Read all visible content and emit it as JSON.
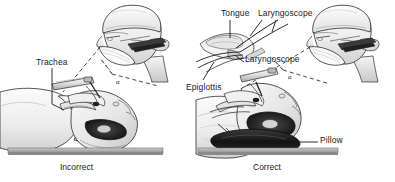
{
  "figure": {
    "width": 395,
    "height": 182,
    "background_color": "#ffffff"
  },
  "panels": [
    {
      "id": "incorrect",
      "caption": "Incorrect",
      "description": "Supine patient with head flat on the table, no pillow; laryngoscope inserted, line of sight misaligned",
      "angle_label": "α",
      "labels": [
        {
          "name": "trachea",
          "text": "Trachea"
        }
      ]
    },
    {
      "id": "correct",
      "caption": "Correct",
      "description": "Supine patient with head elevated on a pillow in sniffing position; laryngoscope inserted, line of sight aligned",
      "angle_label": "α",
      "labels": [
        {
          "name": "tongue",
          "text": "Tongue"
        },
        {
          "name": "laryngoscope-upper",
          "text": "Laryngoscope"
        },
        {
          "name": "laryngoscope-lower",
          "text": "Laryngoscope"
        },
        {
          "name": "epiglottis",
          "text": "Epiglottis"
        },
        {
          "name": "pillow",
          "text": "Pillow"
        }
      ]
    }
  ],
  "labels": {
    "trachea": "Trachea",
    "tongue": "Tongue",
    "laryngoscope_upper": "Laryngoscope",
    "laryngoscope_lower": "Laryngoscope",
    "epiglottis": "Epiglottis",
    "pillow": "Pillow",
    "angle_alpha": "α"
  },
  "captions": {
    "incorrect": "Incorrect",
    "correct": "Correct"
  },
  "colors": {
    "line": "#1a1a1a",
    "label_text": "#1a1a1a",
    "skin_light": "#f2f2f2",
    "skin_shade": "#d9d9d9",
    "skin_shadow": "#bdbdbd",
    "table_top": "#b5b5b5",
    "table_edge": "#8f8f8f",
    "pillow": "#1d1d1d",
    "instrument": "#e8e8e8",
    "instrument_dark": "#4a4a4a",
    "background": "#ffffff"
  }
}
